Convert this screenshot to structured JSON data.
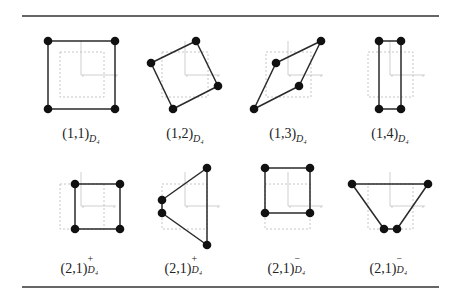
{
  "figure": {
    "rules": [
      {
        "name": "top-rule",
        "x1": 22,
        "x2": 439,
        "y": 16
      },
      {
        "name": "bottom-rule",
        "x1": 22,
        "x2": 439,
        "y": 287
      }
    ],
    "colors": {
      "polygon": "#2a2a2a",
      "vertex": "#111111",
      "dashed": "#b8b8b8",
      "axis": "#b0b0b0"
    },
    "panels": [
      {
        "id": "1-1",
        "label": {
          "main": "(1,1)",
          "sub": "D4",
          "sup": "",
          "x": 81,
          "y": 140
        },
        "axes": {
          "ox": 81,
          "oy": 75,
          "top": 41,
          "right": 118
        },
        "dashed": {
          "x": 60,
          "y": 52,
          "w": 44,
          "h": 45
        },
        "vertices": [
          [
            48,
            41
          ],
          [
            115,
            41
          ],
          [
            115,
            109
          ],
          [
            48,
            109
          ]
        ]
      },
      {
        "id": "1-2",
        "label": {
          "main": "(1,2)",
          "sub": "D4",
          "sup": "",
          "x": 185,
          "y": 140
        },
        "axes": {
          "ox": 185,
          "oy": 75,
          "top": 41,
          "right": 220
        },
        "dashed": {
          "x": 162,
          "y": 52,
          "w": 46,
          "h": 45
        },
        "vertices": [
          [
            196,
            41
          ],
          [
            218,
            86
          ],
          [
            173,
            109
          ],
          [
            151,
            63
          ]
        ]
      },
      {
        "id": "1-3",
        "label": {
          "main": "(1,3)",
          "sub": "D4",
          "sup": "",
          "x": 288,
          "y": 140
        },
        "axes": {
          "ox": 288,
          "oy": 75,
          "top": 41,
          "right": 323
        },
        "dashed": {
          "x": 266,
          "y": 52,
          "w": 45,
          "h": 45
        },
        "vertices": [
          [
            321,
            41
          ],
          [
            299,
            86
          ],
          [
            254,
            109
          ],
          [
            276,
            63
          ]
        ]
      },
      {
        "id": "1-4",
        "label": {
          "main": "(1,4)",
          "sub": "D4",
          "sup": "",
          "x": 390,
          "y": 140
        },
        "axes": {
          "ox": 390,
          "oy": 75,
          "top": 41,
          "right": 425
        },
        "dashed": {
          "x": 368,
          "y": 52,
          "w": 45,
          "h": 45
        },
        "vertices": [
          [
            379,
            41
          ],
          [
            401,
            41
          ],
          [
            401,
            109
          ],
          [
            379,
            109
          ]
        ]
      },
      {
        "id": "2-1-plus-a",
        "label": {
          "main": "(2,1)",
          "sub": "D4",
          "sup": "+",
          "x": 81,
          "y": 273
        },
        "axes": {
          "ox": 81,
          "oy": 206,
          "top": 172,
          "right": 116
        },
        "dashed": {
          "x": 60,
          "y": 184,
          "w": 44,
          "h": 45
        },
        "vertices": [
          [
            75,
            184
          ],
          [
            120,
            184
          ],
          [
            120,
            229
          ],
          [
            75,
            229
          ]
        ]
      },
      {
        "id": "2-1-plus-b",
        "label": {
          "main": "(2,1)",
          "sub": "D4",
          "sup": "+",
          "x": 185,
          "y": 273
        },
        "axes": {
          "ox": 185,
          "oy": 206,
          "top": 172,
          "right": 220
        },
        "dashed": {
          "x": 162,
          "y": 184,
          "w": 45,
          "h": 45
        },
        "vertices": [
          [
            207,
            168
          ],
          [
            207,
            245
          ],
          [
            162,
            213
          ],
          [
            162,
            200
          ]
        ]
      },
      {
        "id": "2-1-minus-a",
        "label": {
          "main": "(2,1)",
          "sub": "D4",
          "sup": "−",
          "x": 288,
          "y": 273
        },
        "axes": {
          "ox": 288,
          "oy": 206,
          "top": 172,
          "right": 323
        },
        "dashed": {
          "x": 265,
          "y": 184,
          "w": 45,
          "h": 45
        },
        "vertices": [
          [
            265,
            168
          ],
          [
            310,
            168
          ],
          [
            310,
            213
          ],
          [
            265,
            213
          ]
        ]
      },
      {
        "id": "2-1-minus-b",
        "label": {
          "main": "(2,1)",
          "sub": "D4",
          "sup": "−",
          "x": 390,
          "y": 273
        },
        "axes": {
          "ox": 390,
          "oy": 206,
          "top": 172,
          "right": 425
        },
        "dashed": {
          "x": 368,
          "y": 184,
          "w": 45,
          "h": 45
        },
        "vertices": [
          [
            352,
            184
          ],
          [
            428,
            184
          ],
          [
            397,
            229
          ],
          [
            384,
            229
          ]
        ]
      }
    ]
  }
}
